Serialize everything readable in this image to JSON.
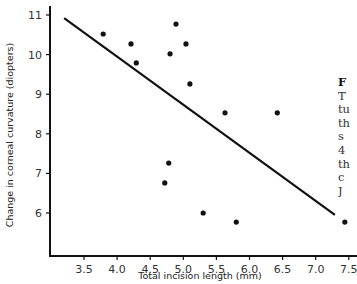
{
  "chart_data": {
    "type": "scatter",
    "title": "",
    "xlabel": "Total incision length (mm)",
    "ylabel": "Change in corneal curvature (diopters)",
    "xlim": [
      3.0,
      7.55
    ],
    "ylim": [
      5.45,
      11.1
    ],
    "xticks": [
      "3.5",
      "4.0",
      "4.5",
      "5.0",
      "5.5",
      "6.0",
      "6.5",
      "7.0",
      "7.5"
    ],
    "yticks": [
      "6",
      "7",
      "8",
      "9",
      "10",
      "11"
    ],
    "grid": false,
    "legend": null,
    "series": [
      {
        "name": "Observations",
        "points": [
          [
            3.79,
            10.52
          ],
          [
            4.21,
            10.27
          ],
          [
            4.29,
            9.79
          ],
          [
            4.8,
            10.02
          ],
          [
            4.89,
            10.77
          ],
          [
            5.04,
            10.27
          ],
          [
            5.1,
            9.26
          ],
          [
            5.63,
            8.53
          ],
          [
            6.42,
            8.53
          ],
          [
            4.78,
            7.26
          ],
          [
            4.72,
            6.76
          ],
          [
            5.3,
            6.0
          ],
          [
            5.8,
            5.77
          ],
          [
            7.44,
            5.77
          ]
        ]
      },
      {
        "name": "Regression line",
        "type": "line",
        "points": [
          [
            3.2,
            10.92
          ],
          [
            7.29,
            5.95
          ]
        ]
      }
    ]
  },
  "caption_fragment": {
    "lines": [
      "F",
      "T",
      "tu",
      "th",
      "s",
      "4",
      "th",
      "c",
      "J"
    ]
  }
}
